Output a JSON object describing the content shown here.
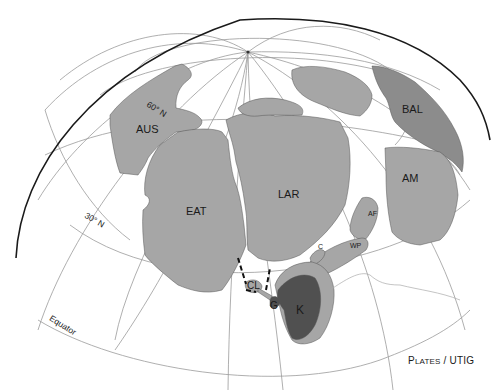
{
  "map": {
    "projection": "orthographic hemisphere",
    "colors": {
      "background": "#ffffff",
      "land_light": "#a6a6a6",
      "land_mid": "#8c8c8c",
      "land_dark": "#505050",
      "grid": "#9a9a9a",
      "outline": "#1a1a1a"
    },
    "graticule_labels": {
      "lat60": "60° N",
      "lat30": "30° N",
      "equator": "Equator"
    },
    "plates": [
      {
        "code": "AUS"
      },
      {
        "code": "EAT"
      },
      {
        "code": "LAR"
      },
      {
        "code": "BAL"
      },
      {
        "code": "AM"
      },
      {
        "code": "AF"
      },
      {
        "code": "WP"
      },
      {
        "code": "C"
      },
      {
        "code": "CL"
      },
      {
        "code": "G"
      },
      {
        "code": "K"
      }
    ],
    "credit": {
      "first_cap": "P",
      "first_rest": "LATES",
      "sep": " / ",
      "second": "UTIG"
    }
  }
}
